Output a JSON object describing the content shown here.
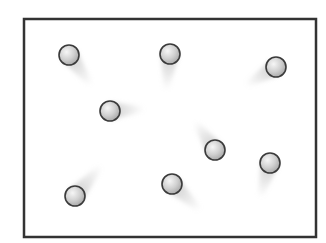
{
  "diagram": {
    "width": 326,
    "height": 243,
    "container": {
      "x": 24,
      "y": 19,
      "width": 292,
      "height": 218,
      "stroke": "#333333",
      "stroke_width": 2.5,
      "fill": "#ffffff"
    },
    "ball_style": {
      "radius": 10,
      "highlight": "#f4f4f4",
      "mid": "#cfcfcf",
      "edge": "#a9a9a9",
      "outline": "#3a3a3a",
      "trail_color": "#bdbdbd"
    },
    "particles": [
      {
        "id": 1,
        "cx": 69,
        "cy": 55,
        "trail_dx": 22,
        "trail_dy": 30
      },
      {
        "id": 2,
        "cx": 170,
        "cy": 54,
        "trail_dx": -4,
        "trail_dy": 36
      },
      {
        "id": 3,
        "cx": 276,
        "cy": 67,
        "trail_dx": -30,
        "trail_dy": 18
      },
      {
        "id": 4,
        "cx": 110,
        "cy": 111,
        "trail_dx": 34,
        "trail_dy": -2
      },
      {
        "id": 5,
        "cx": 215,
        "cy": 150,
        "trail_dx": -20,
        "trail_dy": -28
      },
      {
        "id": 6,
        "cx": 270,
        "cy": 163,
        "trail_dx": -10,
        "trail_dy": 34
      },
      {
        "id": 7,
        "cx": 75,
        "cy": 196,
        "trail_dx": 26,
        "trail_dy": -30
      },
      {
        "id": 8,
        "cx": 172,
        "cy": 184,
        "trail_dx": 28,
        "trail_dy": 26
      }
    ]
  }
}
